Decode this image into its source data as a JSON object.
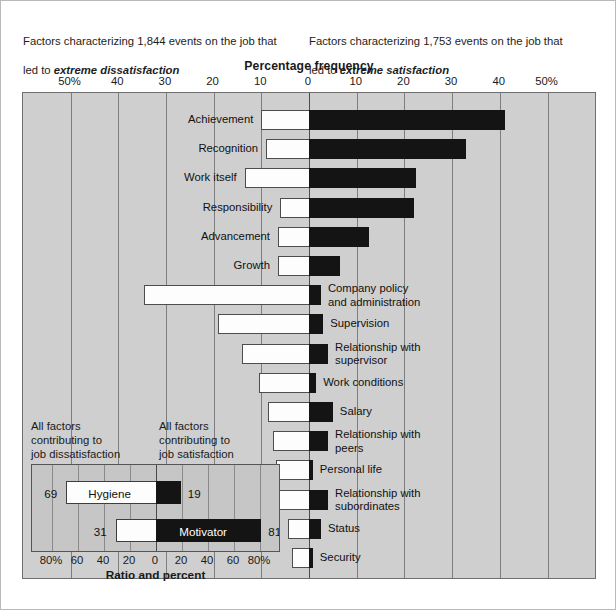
{
  "figure": {
    "caption_left_line1": "Factors characterizing 1,844 events on the job that",
    "caption_left_line2_prefix": "led to ",
    "caption_left_line2_em": "extreme dissatisfaction",
    "caption_right_line1": "Factors characterizing 1,753 events on the job that",
    "caption_right_line2_prefix": "led to ",
    "caption_right_line2_em": "extreme satisfaction",
    "axis_title": "Percentage frequency",
    "colors": {
      "plot_background": "#cfcfcf",
      "bar_negative": "#fdfdfd",
      "bar_positive": "#141414",
      "gridline": "#7d7d7d",
      "inset_background": "#c6c6c6"
    }
  },
  "inset": {
    "caption_left": "All factors\ncontributing to\njob dissatisfaction",
    "caption_right": "All factors\ncontributing to\njob satisfaction",
    "axis_title": "Ratio and percent"
  },
  "chart_data": {
    "type": "bar",
    "title": "Percentage frequency",
    "subtitle_left": "Factors characterizing 1,844 events on the job that led to extreme dissatisfaction",
    "subtitle_right": "Factors characterizing 1,753 events on the job that led to extreme satisfaction",
    "orientation": "horizontal-diverging",
    "xlabel": "Percentage frequency",
    "ylabel": "",
    "xlim": [
      -50,
      50
    ],
    "xticks": [
      -50,
      -40,
      -30,
      -20,
      -10,
      0,
      10,
      20,
      30,
      40,
      50
    ],
    "xticklabels": [
      "50%",
      "40",
      "30",
      "20",
      "10",
      "0",
      "10",
      "20",
      "30",
      "40",
      "50%"
    ],
    "grid": true,
    "legend": null,
    "series": [
      {
        "name": "Dissatisfaction (hygiene side, percent to the left of zero)",
        "color": "#fdfdfd"
      },
      {
        "name": "Satisfaction (motivator side, percent to the right of zero)",
        "color": "#141414"
      }
    ],
    "categories": [
      "Achievement",
      "Recognition",
      "Work itself",
      "Responsibility",
      "Advancement",
      "Growth",
      "Company policy and administration",
      "Supervision",
      "Relationship with supervisor",
      "Work conditions",
      "Salary",
      "Relationship with peers",
      "Personal life",
      "Relationship with subordinates",
      "Status",
      "Security"
    ],
    "rows": [
      {
        "label": "Achievement",
        "label_side": "left",
        "neg": 10.0,
        "pos": 41.0
      },
      {
        "label": "Recognition",
        "label_side": "left",
        "neg": 9.0,
        "pos": 33.0
      },
      {
        "label": "Work itself",
        "label_side": "left",
        "neg": 13.5,
        "pos": 22.5
      },
      {
        "label": "Responsibility",
        "label_side": "left",
        "neg": 6.0,
        "pos": 22.0
      },
      {
        "label": "Advancement",
        "label_side": "left",
        "neg": 6.5,
        "pos": 12.5
      },
      {
        "label": "Growth",
        "label_side": "left",
        "neg": 6.5,
        "pos": 6.5
      },
      {
        "label": "Company policy\nand administration",
        "label_side": "right",
        "neg": 34.5,
        "pos": 2.5
      },
      {
        "label": "Supervision",
        "label_side": "right",
        "neg": 19.0,
        "pos": 3.0
      },
      {
        "label": "Relationship with\nsupervisor",
        "label_side": "right",
        "neg": 14.0,
        "pos": 4.0
      },
      {
        "label": "Work conditions",
        "label_side": "right",
        "neg": 10.5,
        "pos": 1.5
      },
      {
        "label": "Salary",
        "label_side": "right",
        "neg": 8.5,
        "pos": 5.0
      },
      {
        "label": "Relationship with\npeers",
        "label_side": "right",
        "neg": 7.5,
        "pos": 4.0
      },
      {
        "label": "Personal life",
        "label_side": "right",
        "neg": 7.0,
        "pos": 0.8
      },
      {
        "label": "Relationship with\nsubordinates",
        "label_side": "right",
        "neg": 7.0,
        "pos": 4.0
      },
      {
        "label": "Status",
        "label_side": "right",
        "neg": 4.5,
        "pos": 2.5
      },
      {
        "label": "Security",
        "label_side": "right",
        "neg": 3.5,
        "pos": 0.8
      }
    ],
    "inset_chart": {
      "type": "bar",
      "title": "Ratio and percent",
      "xlabel": "Ratio and percent",
      "xlim": [
        -90,
        90
      ],
      "xticks": [
        -80,
        -60,
        -40,
        -20,
        0,
        20,
        40,
        60,
        80
      ],
      "xticklabels": [
        "80%",
        "60",
        "40",
        "20",
        "0",
        "20",
        "40",
        "60",
        "80%"
      ],
      "caption_left": "All factors contributing to job dissatisfaction",
      "caption_right": "All factors contributing to job satisfaction",
      "rows": [
        {
          "label": "Hygiene",
          "neg": 69,
          "pos": 19,
          "neg_label": "69",
          "pos_label": "19",
          "name_on": "white"
        },
        {
          "label": "Motivator",
          "neg": 31,
          "pos": 81,
          "neg_label": "31",
          "pos_label": "81",
          "name_on": "black"
        }
      ]
    }
  }
}
